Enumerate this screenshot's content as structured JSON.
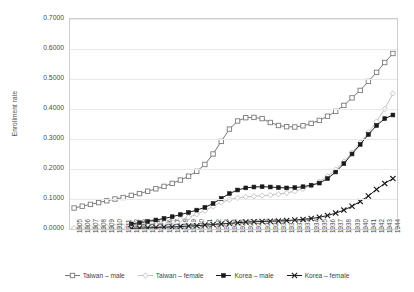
{
  "chart_data": {
    "type": "line",
    "title": "",
    "xlabel": "",
    "ylabel": "Enrollment rate",
    "ylim": [
      0.0,
      0.7
    ],
    "yticks": [
      "0.0000",
      "0.1000",
      "0.2000",
      "0.3000",
      "0.4000",
      "0.5000",
      "0.6000",
      "0.7000"
    ],
    "ytick_values": [
      0.0,
      0.1,
      0.2,
      0.3,
      0.4,
      0.5,
      0.6,
      0.7
    ],
    "grid": true,
    "legend_position": "bottom",
    "x": [
      1905,
      1906,
      1907,
      1908,
      1909,
      1910,
      1911,
      1912,
      1913,
      1914,
      1915,
      1916,
      1917,
      1918,
      1919,
      1920,
      1921,
      1922,
      1923,
      1924,
      1925,
      1926,
      1927,
      1928,
      1929,
      1930,
      1931,
      1932,
      1933,
      1934,
      1935,
      1936,
      1937,
      1938,
      1939,
      1940,
      1941,
      1942,
      1943,
      1944
    ],
    "categories": [
      "1905",
      "1906",
      "1907",
      "1908",
      "1909",
      "1910",
      "1911",
      "1912",
      "1913",
      "1914",
      "1915",
      "1916",
      "1917",
      "1918",
      "1919",
      "1920",
      "1921",
      "1922",
      "1923",
      "1924",
      "1925",
      "1926",
      "1927",
      "1928",
      "1929",
      "1930",
      "1931",
      "1932",
      "1933",
      "1934",
      "1935",
      "1936",
      "1937",
      "1938",
      "1939",
      "1940",
      "1941",
      "1942",
      "1943",
      "1944"
    ],
    "series": [
      {
        "name": "Taiwan – male",
        "marker": "open-square",
        "color": "#7a7a7a",
        "values": [
          0.07,
          0.076,
          0.082,
          0.088,
          0.094,
          0.1,
          0.105,
          0.112,
          0.118,
          0.126,
          0.134,
          0.142,
          0.152,
          0.163,
          0.176,
          0.192,
          0.215,
          0.25,
          0.292,
          0.333,
          0.36,
          0.371,
          0.372,
          0.368,
          0.355,
          0.345,
          0.341,
          0.34,
          0.344,
          0.352,
          0.362,
          0.376,
          0.392,
          0.412,
          0.437,
          0.462,
          0.492,
          0.522,
          0.555,
          0.585
        ]
      },
      {
        "name": "Taiwan – female",
        "marker": "open-diamond",
        "color": "#bfbfbf",
        "values": [
          0.003,
          0.004,
          0.004,
          0.005,
          0.006,
          0.007,
          0.008,
          0.009,
          0.011,
          0.013,
          0.016,
          0.02,
          0.025,
          0.031,
          0.039,
          0.049,
          0.061,
          0.075,
          0.089,
          0.098,
          0.104,
          0.107,
          0.109,
          0.111,
          0.113,
          0.116,
          0.12,
          0.126,
          0.134,
          0.145,
          0.158,
          0.176,
          0.198,
          0.224,
          0.255,
          0.288,
          0.322,
          0.358,
          0.4,
          0.452
        ]
      },
      {
        "name": "Korea – male",
        "marker": "filled-square",
        "color": "#1a1a1a",
        "values": [
          null,
          null,
          null,
          null,
          null,
          null,
          null,
          0.017,
          0.021,
          0.025,
          0.03,
          0.035,
          0.041,
          0.048,
          0.055,
          0.063,
          0.072,
          0.085,
          0.102,
          0.118,
          0.13,
          0.137,
          0.14,
          0.141,
          0.14,
          0.138,
          0.137,
          0.138,
          0.141,
          0.146,
          0.153,
          0.168,
          0.19,
          0.218,
          0.25,
          0.282,
          0.315,
          0.345,
          0.368,
          0.38
        ]
      },
      {
        "name": "Korea – female",
        "marker": "cross",
        "color": "#1a1a1a",
        "values": [
          null,
          null,
          null,
          null,
          null,
          null,
          null,
          0.002,
          0.003,
          0.004,
          0.005,
          0.006,
          0.007,
          0.008,
          0.01,
          0.011,
          0.013,
          0.015,
          0.017,
          0.019,
          0.021,
          0.023,
          0.024,
          0.025,
          0.026,
          0.027,
          0.028,
          0.03,
          0.032,
          0.035,
          0.039,
          0.045,
          0.053,
          0.063,
          0.076,
          0.092,
          0.11,
          0.132,
          0.152,
          0.168
        ]
      }
    ]
  },
  "axis": {
    "y_title": "Enrollment rate"
  },
  "legend": {
    "items": [
      {
        "label": "Taiwan – male"
      },
      {
        "label": "Taiwan – female"
      },
      {
        "label": "Korea – male"
      },
      {
        "label": "Korea – female"
      }
    ]
  }
}
